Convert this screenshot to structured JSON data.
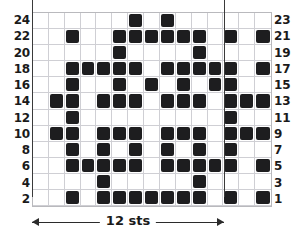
{
  "chart_data": {
    "type": "heatmap",
    "title": "",
    "xlabel": "12 sts",
    "ylabel": "",
    "grid": true,
    "legend_position": "none",
    "columns": 15,
    "rows": 12,
    "cell_meaning": "filled square = patterned stitch, empty square = plain stitch",
    "repeat_start_column": 2,
    "repeat_end_column": 14,
    "repeat_width_stitches": 12,
    "left_axis_tick_labels": [
      "24",
      "22",
      "20",
      "18",
      "16",
      "14",
      "12",
      "10",
      "8",
      "6",
      "4",
      "2"
    ],
    "right_axis_tick_labels": [
      "23",
      "21",
      "19",
      "17",
      "15",
      "13",
      "11",
      "9",
      "7",
      "5",
      "3",
      "1"
    ],
    "row_names": [
      "24 / 23",
      "22 / 21",
      "20 / 19",
      "18 / 17",
      "16 / 15",
      "14 / 13",
      "12 / 11",
      "10 / 9",
      "8 / 7",
      "6 / 5",
      "4 / 3",
      "2 / 1"
    ],
    "filled_cells_by_row": [
      [
        6,
        8
      ],
      [
        2,
        5,
        6,
        7,
        8,
        9,
        10,
        12,
        14
      ],
      [
        5,
        10
      ],
      [
        2,
        3,
        4,
        5,
        6,
        8,
        9,
        10,
        11,
        12,
        14
      ],
      [
        2,
        5,
        7,
        9,
        11,
        12
      ],
      [
        1,
        2,
        4,
        5,
        6,
        8,
        9,
        10,
        12,
        13,
        14
      ],
      [
        2,
        12
      ],
      [
        1,
        2,
        4,
        5,
        6,
        8,
        9,
        10,
        12,
        13,
        14
      ],
      [
        2,
        4,
        6,
        8,
        10,
        12
      ],
      [
        2,
        3,
        4,
        5,
        6,
        8,
        9,
        10,
        11,
        12,
        14
      ],
      [
        4,
        10
      ],
      [
        2,
        4,
        5,
        6,
        7,
        8,
        9,
        10,
        12,
        14
      ]
    ],
    "colors": {
      "filled": "#1d1d1f",
      "empty": "#ffffff",
      "gridline": "#cfcfd4",
      "border": "#b9b9bd",
      "repeat_line": "#3a3a3a",
      "text": "#1a1a1a"
    }
  },
  "footer": {
    "sts_label": "12 sts"
  },
  "top_caption": {
    "text": ""
  }
}
